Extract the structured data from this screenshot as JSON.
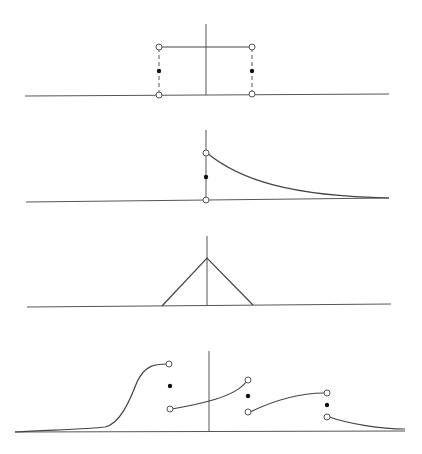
{
  "figure": {
    "colors": {
      "line": "#444444",
      "axis": "#555555",
      "open_point_fill": "#ffffff",
      "closed_point": "#111111"
    }
  },
  "panels": [
    {
      "name": "rectangular-pulse",
      "axis": {
        "x1": 25,
        "y1": 96,
        "x2": 389,
        "y2": 94
      },
      "vaxis": {
        "x1": 206,
        "y1": 24,
        "x2": 206,
        "y2": 95
      },
      "paths": [
        {
          "d": "M159 47 L252 47",
          "style": "curve"
        }
      ],
      "dashed": [
        {
          "x1": 159,
          "y1": 48,
          "x2": 159,
          "y2": 94
        },
        {
          "x1": 252,
          "y1": 48,
          "x2": 252,
          "y2": 93
        }
      ],
      "open_points": [
        [
          159,
          47
        ],
        [
          252,
          47
        ],
        [
          159,
          95
        ],
        [
          252,
          94
        ]
      ],
      "closed_points": [
        [
          159,
          71
        ],
        [
          252,
          71
        ]
      ]
    },
    {
      "name": "one-sided-exponential",
      "axis": {
        "x1": 26,
        "y1": 202,
        "x2": 389,
        "y2": 198
      },
      "vaxis": {
        "x1": 206,
        "y1": 130,
        "x2": 206,
        "y2": 200
      },
      "paths": [
        {
          "d": "M207 153 C240 180, 290 196, 389 198",
          "style": "curve"
        }
      ],
      "dashed": [],
      "open_points": [
        [
          206,
          153
        ],
        [
          206,
          200
        ]
      ],
      "closed_points": [
        [
          206,
          177
        ]
      ]
    },
    {
      "name": "triangle",
      "axis": {
        "x1": 27,
        "y1": 307,
        "x2": 391,
        "y2": 304
      },
      "vaxis": {
        "x1": 207,
        "y1": 236,
        "x2": 207,
        "y2": 306
      },
      "paths": [
        {
          "d": "M162 306 L207 258 L253 305",
          "style": "curve"
        }
      ],
      "dashed": [],
      "open_points": [],
      "closed_points": []
    },
    {
      "name": "piecewise-with-jumps",
      "axis": {
        "x1": 15,
        "y1": 432,
        "x2": 405,
        "y2": 431
      },
      "vaxis": {
        "x1": 209,
        "y1": 351,
        "x2": 209,
        "y2": 432
      },
      "paths": [
        {
          "d": "M15 432 C50 430, 90 429, 105 427 C120 424, 130 400, 137 382 C145 365, 155 364, 167 364",
          "style": "curve"
        },
        {
          "d": "M172 409 C200 404, 235 397, 246 382",
          "style": "curve"
        },
        {
          "d": "M250 412 C275 400, 300 393, 324 393",
          "style": "curve"
        },
        {
          "d": "M329 417 C350 424, 380 429, 405 429",
          "style": "curve"
        }
      ],
      "dashed": [],
      "open_points": [
        [
          169,
          364
        ],
        [
          170,
          409
        ],
        [
          248,
          380
        ],
        [
          248,
          412
        ],
        [
          327,
          393
        ],
        [
          327,
          417
        ]
      ],
      "closed_points": [
        [
          170,
          386
        ],
        [
          248,
          396
        ],
        [
          327,
          405
        ]
      ]
    }
  ]
}
